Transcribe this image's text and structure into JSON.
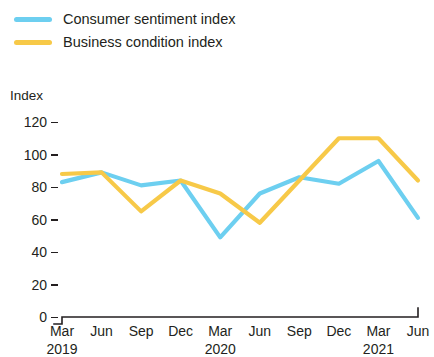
{
  "legend": {
    "items": [
      {
        "label": "Consumer sentiment index",
        "color": "#6dcff0",
        "swatch_name": "legend-swatch-consumer"
      },
      {
        "label": "Business condition index",
        "color": "#f7c948",
        "swatch_name": "legend-swatch-business"
      }
    ]
  },
  "axis": {
    "y_title": "Index",
    "y_ticks": [
      "120",
      "100",
      "80",
      "60",
      "40",
      "20",
      "0"
    ],
    "x_ticks": [
      "Mar",
      "Jun",
      "Sep",
      "Dec",
      "Mar",
      "Jun",
      "Sep",
      "Dec",
      "Mar",
      "Jun"
    ],
    "x_years": [
      "2019",
      "2020",
      "2021"
    ]
  },
  "chart_data": {
    "type": "line",
    "title": "",
    "xlabel": "",
    "ylabel": "Index",
    "ylim": [
      0,
      130
    ],
    "yticks": [
      0,
      20,
      40,
      60,
      80,
      100,
      120
    ],
    "grid": false,
    "legend_position": "top-left",
    "categories": [
      "Mar 2019",
      "Jun 2019",
      "Sep 2019",
      "Dec 2019",
      "Mar 2020",
      "Jun 2020",
      "Sep 2020",
      "Dec 2020",
      "Mar 2021",
      "Jun 2021"
    ],
    "series": [
      {
        "name": "Consumer sentiment index",
        "color": "#6dcff0",
        "values": [
          83,
          89,
          81,
          84,
          49,
          76,
          86,
          82,
          96,
          61
        ]
      },
      {
        "name": "Business condition index",
        "color": "#f7c948",
        "values": [
          88,
          89,
          65,
          84,
          76,
          58,
          84,
          110,
          110,
          84
        ]
      }
    ]
  }
}
